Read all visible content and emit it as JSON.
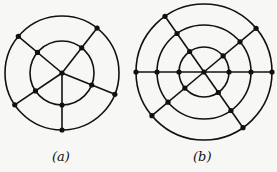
{
  "figures": [
    {
      "id": "a",
      "caption": "(a)",
      "description": "Two concentric circles with a central vertex connected by 5 spokes to the inner and outer circles",
      "rings": 2,
      "spoke_count": 5,
      "has_center_vertex": true
    },
    {
      "id": "b",
      "caption": "(b)",
      "description": "Three concentric circles crossed by three straight lines through the center (6 spokes)",
      "rings": 3,
      "spoke_count": 6,
      "has_center_vertex": true
    }
  ]
}
